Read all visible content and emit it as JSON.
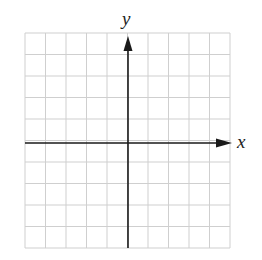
{
  "figure": {
    "type": "coordinate-grid",
    "x_axis_label": "x",
    "y_axis_label": "y",
    "grid": {
      "columns": 10,
      "rows": 10,
      "x_range": [
        -5,
        5
      ],
      "y_range": [
        -5,
        5
      ]
    },
    "colors": {
      "grid": "#cfcfcf",
      "axes": "#1a1a1a",
      "labels": "#222222"
    }
  }
}
